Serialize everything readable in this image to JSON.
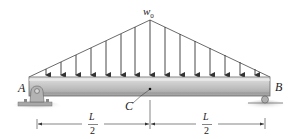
{
  "diagram": {
    "type": "simply-supported beam with triangular distributed load",
    "load": {
      "label": "w",
      "label_sub": "0",
      "shape": "triangular, peak at midspan",
      "arrow_count": 15
    },
    "supports": {
      "left": {
        "label": "A",
        "type": "pin"
      },
      "right": {
        "label": "B",
        "type": "roller"
      }
    },
    "point": {
      "label": "C",
      "location": "midspan"
    },
    "dimensions": [
      {
        "num": "L",
        "den": "2"
      },
      {
        "num": "L",
        "den": "2"
      }
    ],
    "colors": {
      "beam_top": "#d8d8d8",
      "beam_face": "#bdbdbd",
      "beam_edge": "#6b6b6b",
      "support": "#9a9a9a",
      "ground": "#c4c4c4",
      "line": "#333333"
    }
  }
}
